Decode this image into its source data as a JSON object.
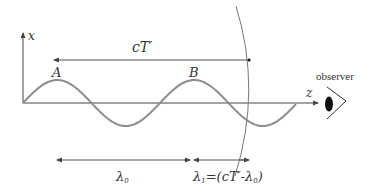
{
  "figure": {
    "axis_labels": {
      "vertical": "x",
      "horizontal": "z"
    },
    "points": {
      "first_peak": "A",
      "second_peak": "B"
    },
    "period_span_label": "cT′",
    "observer_label": "observer",
    "wavelength_labels": {
      "emitted": "λ",
      "emitted_sub": "0",
      "received": "λ",
      "received_sub": "1",
      "received_expr": "=(cT′-λ",
      "received_expr_sub": "0",
      "received_expr_close": ")"
    },
    "colors": {
      "wave": "#8c8c8c",
      "axes": "#444444",
      "wavefront": "#777777",
      "text": "#333333",
      "eye": "#111111"
    }
  }
}
